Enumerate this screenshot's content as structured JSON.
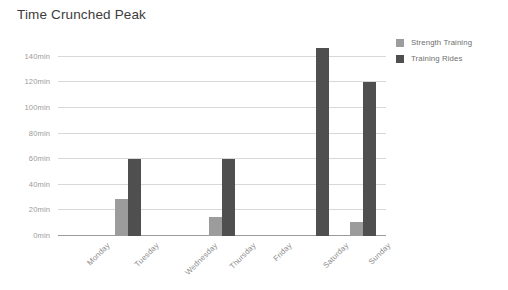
{
  "chart_data": {
    "type": "bar",
    "title": "Time Crunched Peak",
    "xlabel": "",
    "ylabel": "",
    "categories": [
      "Monday",
      "Tuesday",
      "Wednesday",
      "Thursday",
      "Friday",
      "Saturday",
      "Sunday"
    ],
    "series": [
      {
        "name": "Strength Training",
        "color": "#9c9c9c",
        "values": [
          0,
          29,
          0,
          15,
          0,
          0,
          11
        ]
      },
      {
        "name": "Training Rides",
        "color": "#4f4f4f",
        "values": [
          0,
          60,
          0,
          60,
          0,
          147,
          120
        ]
      }
    ],
    "ylim": [
      0,
      150
    ],
    "yticks": [
      0,
      20,
      40,
      60,
      80,
      100,
      120,
      140
    ],
    "ytick_labels": [
      "0min",
      "20min",
      "40min",
      "60min",
      "80min",
      "100min",
      "120min",
      "140min"
    ],
    "grid": true,
    "legend_position": "top-right",
    "units": "min"
  },
  "legend": {
    "items": [
      {
        "label": "Strength Training"
      },
      {
        "label": "Training Rides"
      }
    ]
  }
}
